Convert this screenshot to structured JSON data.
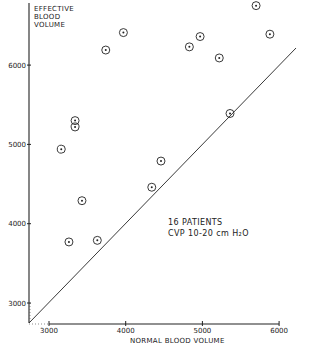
{
  "chart_data": {
    "type": "scatter",
    "title": "",
    "xlabel": "NORMAL BLOOD VOLUME",
    "ylabel_lines": [
      "EFFECTIVE",
      "BLOOD",
      "VOLUME"
    ],
    "xlim": [
      2740,
      6200
    ],
    "ylim": [
      2740,
      6800
    ],
    "x_ticks": [
      3000,
      4000,
      5000,
      6000
    ],
    "y_ticks": [
      3000,
      4000,
      5000,
      6000
    ],
    "x_tick_labels": [
      "3000",
      "4000",
      "5000",
      "6000"
    ],
    "y_tick_labels": [
      "3000",
      "4000",
      "5000",
      "6000"
    ],
    "grid": false,
    "legend": null,
    "annotation_lines": [
      "16 PATIENTS",
      "CVP  10-20 cm H₂O"
    ],
    "reference_line": {
      "type": "identity",
      "label": "y = x",
      "from": [
        2740,
        2740
      ],
      "to": [
        6200,
        6200
      ]
    },
    "series": [
      {
        "name": "Patients",
        "marker": "circled-dot",
        "points": [
          {
            "x": 5700,
            "y": 6750
          },
          {
            "x": 5880,
            "y": 6390
          },
          {
            "x": 3970,
            "y": 6410
          },
          {
            "x": 3740,
            "y": 6190
          },
          {
            "x": 4830,
            "y": 6230
          },
          {
            "x": 4970,
            "y": 6360
          },
          {
            "x": 5220,
            "y": 6090
          },
          {
            "x": 3340,
            "y": 5300
          },
          {
            "x": 3340,
            "y": 5220
          },
          {
            "x": 3160,
            "y": 4940
          },
          {
            "x": 5360,
            "y": 5390
          },
          {
            "x": 4460,
            "y": 4790
          },
          {
            "x": 4340,
            "y": 4460
          },
          {
            "x": 3430,
            "y": 4290
          },
          {
            "x": 3260,
            "y": 3770
          },
          {
            "x": 3630,
            "y": 3790
          }
        ]
      }
    ]
  }
}
